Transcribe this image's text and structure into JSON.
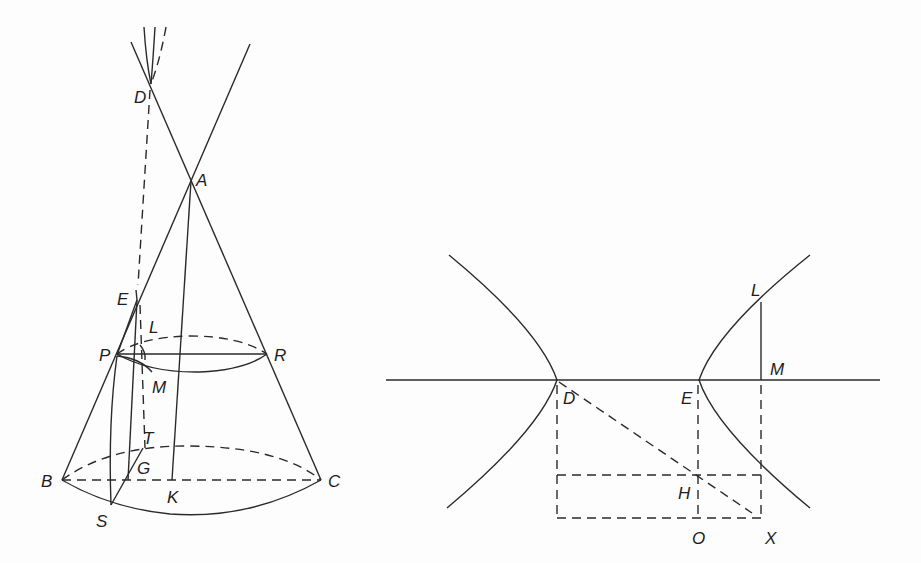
{
  "figure": {
    "left_panel": {
      "title": "Cone with section",
      "labels": {
        "D": "D",
        "A": "A",
        "E": "E",
        "L": "L",
        "P": "P",
        "R": "R",
        "M": "M",
        "T": "T",
        "G": "G",
        "B": "B",
        "C": "C",
        "K": "K",
        "S": "S"
      }
    },
    "right_panel": {
      "title": "Hyperbola",
      "labels": {
        "L": "L",
        "M": "M",
        "D": "D",
        "E": "E",
        "H": "H",
        "O": "O",
        "X": "X"
      }
    },
    "colors": {
      "stroke": "#2a2a2a",
      "background": "#fdfdfd"
    }
  }
}
